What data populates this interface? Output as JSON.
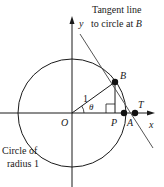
{
  "diagram": {
    "title_annotation": {
      "line1": "Tangent line",
      "line2_prefix": "to circle at ",
      "line2_point": "B"
    },
    "circle_annotation": {
      "line1": "Circle of",
      "line2": "radius 1"
    },
    "axes": {
      "x_label": "x",
      "y_label": "y"
    },
    "points": {
      "origin": "O",
      "B": "B",
      "P": "P",
      "A": "A",
      "T": "T"
    },
    "radius_label": "1",
    "angle_label": "θ",
    "colors": {
      "stroke": "#1a1a1a",
      "tangent": "#555555",
      "background": "#ffffff"
    }
  }
}
